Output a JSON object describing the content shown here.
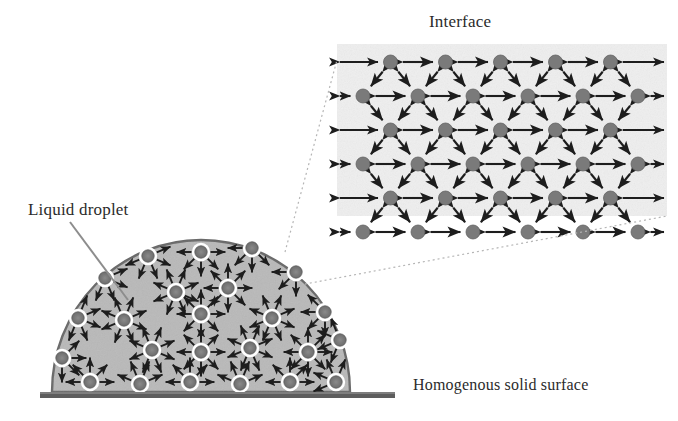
{
  "figure": {
    "kind": "scientific-diagram",
    "background_color": "#ffffff"
  },
  "labels": {
    "interface": "Interface",
    "liquid_droplet": "Liquid droplet",
    "solid_surface": "Homogenous solid surface"
  },
  "colors": {
    "molecule_fill": "#7a7a7a",
    "molecule_fill_dark": "#6e6e6e",
    "molecule_ring": "#ffffff",
    "droplet_fill": "#b9b9b9",
    "droplet_edge": "#6a6a6a",
    "inset_fill": "#efefef",
    "arrow": "#1d1d1d",
    "surface_bar": "#5d5d5d",
    "leader_line": "#8d8d8d",
    "leader_dotted": "#b5b5b5",
    "text": "#2b2b2b"
  },
  "droplet": {
    "shape": "semicircular-dome",
    "center_x": 201,
    "base_y": 392,
    "radius_x": 149,
    "radius_y": 152,
    "molecule_radius": 6.2,
    "arrow_count_per_molecule": 8,
    "arrow_length": 15,
    "molecules": [
      {
        "x": 201,
        "y": 252
      },
      {
        "x": 148,
        "y": 256
      },
      {
        "x": 252,
        "y": 248
      },
      {
        "x": 105,
        "y": 278
      },
      {
        "x": 296,
        "y": 272
      },
      {
        "x": 176,
        "y": 292
      },
      {
        "x": 228,
        "y": 288
      },
      {
        "x": 78,
        "y": 318
      },
      {
        "x": 325,
        "y": 312
      },
      {
        "x": 124,
        "y": 320
      },
      {
        "x": 201,
        "y": 314
      },
      {
        "x": 272,
        "y": 318
      },
      {
        "x": 62,
        "y": 358
      },
      {
        "x": 152,
        "y": 350
      },
      {
        "x": 201,
        "y": 352
      },
      {
        "x": 250,
        "y": 348
      },
      {
        "x": 308,
        "y": 352
      },
      {
        "x": 340,
        "y": 340
      },
      {
        "x": 90,
        "y": 382
      },
      {
        "x": 140,
        "y": 384
      },
      {
        "x": 190,
        "y": 382
      },
      {
        "x": 240,
        "y": 384
      },
      {
        "x": 290,
        "y": 382
      },
      {
        "x": 336,
        "y": 382
      }
    ]
  },
  "surface": {
    "x": 40,
    "y": 392,
    "width": 355,
    "height": 6
  },
  "inset": {
    "x": 337,
    "y": 44,
    "width": 330,
    "height": 172,
    "rows": 6,
    "molecules_odd_row": 5,
    "molecules_even_row": 6,
    "lattice": "hexagonal-alternating",
    "molecule_radius": 7,
    "row_spacing": 34,
    "col_spacing": 55,
    "interaction_arrows": "double-headed horizontal and diagonal"
  },
  "leaders": {
    "liquid_droplet_line": {
      "x1": 70,
      "y1": 222,
      "x2": 128,
      "y2": 300
    },
    "inset_upper": {
      "x1": 285,
      "y1": 252,
      "x2": 337,
      "y2": 60
    },
    "inset_lower": {
      "x1": 300,
      "y1": 285,
      "x2": 667,
      "y2": 216
    }
  }
}
